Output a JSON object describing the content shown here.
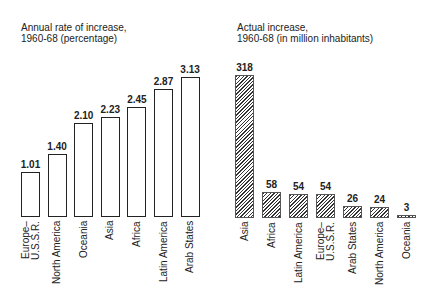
{
  "chart_data": [
    {
      "type": "bar",
      "title": "Annual rate of increase, 1960-68 (percentage)",
      "title_lines": [
        "Annual rate of increase,",
        "1960-68 (percentage)"
      ],
      "categories": [
        "Europe–U.S.S.R.",
        "North America",
        "Oceania",
        "Asia",
        "Africa",
        "Latin America",
        "Arab States"
      ],
      "values": [
        1.01,
        1.4,
        2.1,
        2.23,
        2.45,
        2.87,
        3.13
      ],
      "value_labels": [
        "1.01",
        "1.40",
        "2.10",
        "2.23",
        "2.45",
        "2.87",
        "3.13"
      ],
      "style": "outline",
      "xlabel": "",
      "ylabel": "",
      "grid": false
    },
    {
      "type": "bar",
      "title": "Actual increase, 1960-68 (in million inhabitants)",
      "title_lines": [
        "Actual increase,",
        "1960-68 (in million inhabitants)"
      ],
      "categories": [
        "Asia",
        "Africa",
        "Latin America",
        "Europe–U.S.S.R.",
        "Arab States",
        "North America",
        "Oceania"
      ],
      "values": [
        318,
        58,
        54,
        54,
        26,
        24,
        3
      ],
      "value_labels": [
        "318",
        "58",
        "54",
        "54",
        "26",
        "24",
        "3"
      ],
      "style": "hatched",
      "xlabel": "",
      "ylabel": "",
      "grid": false
    }
  ],
  "left": {
    "title1": "Annual rate of increase,",
    "title2": "1960-68 (percentage)",
    "bars": [
      {
        "label": "Europe–\nU.S.S.R.",
        "value": "1.01"
      },
      {
        "label": "North America",
        "value": "1.40"
      },
      {
        "label": "Oceania",
        "value": "2.10"
      },
      {
        "label": "Asia",
        "value": "2.23"
      },
      {
        "label": "Africa",
        "value": "2.45"
      },
      {
        "label": "Latin America",
        "value": "2.87"
      },
      {
        "label": "Arab States",
        "value": "3.13"
      }
    ]
  },
  "right": {
    "title1": "Actual increase,",
    "title2": "1960-68 (in million inhabitants)",
    "bars": [
      {
        "label": "Asia",
        "value": "318"
      },
      {
        "label": "Africa",
        "value": "58"
      },
      {
        "label": "Latin America",
        "value": "54"
      },
      {
        "label": "Europe–\nU.S.S.R.",
        "value": "54"
      },
      {
        "label": "Arab States",
        "value": "26"
      },
      {
        "label": "North America",
        "value": "24"
      },
      {
        "label": "Oceania",
        "value": "3"
      }
    ]
  }
}
